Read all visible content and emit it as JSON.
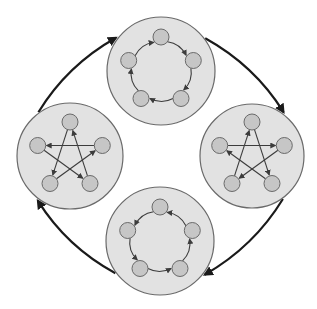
{
  "diagram": {
    "type": "cycle-of-graphs",
    "width": 317,
    "height": 309,
    "colors": {
      "background": "#ffffff",
      "panel_fill": "#e2e2e2",
      "panel_stroke": "#6a6a6a",
      "node_fill": "#c6c6c6",
      "node_stroke": "#6a6a6a",
      "edge": "#3c3c3c",
      "cycle_arrow": "#1a1a1a"
    },
    "panels": [
      {
        "id": "top",
        "shape": "pentagon-ring",
        "cx": 161,
        "cy": 71,
        "r": 54,
        "direction": "clockwise"
      },
      {
        "id": "right",
        "shape": "pentagram",
        "cx": 252,
        "cy": 156,
        "r": 52,
        "direction": "forward"
      },
      {
        "id": "bottom",
        "shape": "pentagon-ring",
        "cx": 160,
        "cy": 241,
        "r": 54,
        "direction": "counterclockwise"
      },
      {
        "id": "left",
        "shape": "pentagram",
        "cx": 70,
        "cy": 156,
        "r": 53,
        "direction": "reverse"
      }
    ],
    "node_count_per_panel": 5,
    "node_radius": 8,
    "node_orbit_radius": 34,
    "cycle": [
      "top",
      "right",
      "bottom",
      "left",
      "top"
    ]
  }
}
